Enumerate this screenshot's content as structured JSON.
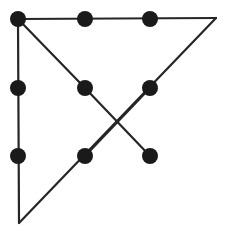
{
  "figure": {
    "background_color": "#ffffff",
    "width": 230,
    "height": 237
  },
  "chart_data": {
    "type": "diagram",
    "title": "",
    "xlabel": "",
    "ylabel": "",
    "grid": false,
    "legend": null,
    "xlim": [
      0,
      230
    ],
    "ylim": [
      0,
      237
    ],
    "style": {
      "node_color": "#1a1a1a",
      "node_radius": 8,
      "edge_color": "#262626",
      "edge_width": 2.2,
      "background": "#ffffff"
    },
    "nodes": [
      {
        "id": "n1",
        "label": "top-left",
        "x": 18,
        "y": 19,
        "marker": "filled-circle"
      },
      {
        "id": "n2",
        "label": "top-middle",
        "x": 85,
        "y": 19,
        "marker": "filled-circle"
      },
      {
        "id": "n3",
        "label": "top-right",
        "x": 150,
        "y": 19,
        "marker": "filled-circle"
      },
      {
        "id": "n4",
        "label": "middle-left",
        "x": 18,
        "y": 88,
        "marker": "filled-circle"
      },
      {
        "id": "n5",
        "label": "middle-center",
        "x": 85,
        "y": 88,
        "marker": "filled-circle"
      },
      {
        "id": "n6",
        "label": "middle-right",
        "x": 150,
        "y": 88,
        "marker": "filled-circle"
      },
      {
        "id": "n7",
        "label": "lower-left",
        "x": 18,
        "y": 156,
        "marker": "filled-circle"
      },
      {
        "id": "n8",
        "label": "lower-center",
        "x": 85,
        "y": 156,
        "marker": "filled-circle"
      },
      {
        "id": "n9",
        "label": "lower-right",
        "x": 150,
        "y": 156,
        "marker": "filled-circle"
      }
    ],
    "vertices": [
      {
        "id": "v1",
        "label": "apex-right-corner",
        "x": 216,
        "y": 18,
        "marker": "none"
      },
      {
        "id": "v2",
        "label": "apex-bottom-corner",
        "x": 19,
        "y": 223,
        "marker": "none"
      }
    ],
    "edges": [
      {
        "id": "e1",
        "label": "top-horizontal",
        "x1": 18,
        "y1": 19,
        "x2": 216,
        "y2": 18
      },
      {
        "id": "e2",
        "label": "left-vertical",
        "x1": 18,
        "y1": 19,
        "x2": 19,
        "y2": 223
      },
      {
        "id": "e3",
        "label": "hypotenuse",
        "x1": 216,
        "y1": 18,
        "x2": 19,
        "y2": 223
      },
      {
        "id": "e4",
        "label": "upper-diagonal",
        "x1": 18,
        "y1": 19,
        "x2": 85,
        "y2": 88
      },
      {
        "id": "e5",
        "label": "cross-down-right",
        "x1": 85,
        "y1": 88,
        "x2": 150,
        "y2": 156
      },
      {
        "id": "e6",
        "label": "cross-down-left",
        "x1": 150,
        "y1": 88,
        "x2": 85,
        "y2": 156
      }
    ],
    "crossing_point": {
      "x": 117,
      "y": 122
    }
  }
}
